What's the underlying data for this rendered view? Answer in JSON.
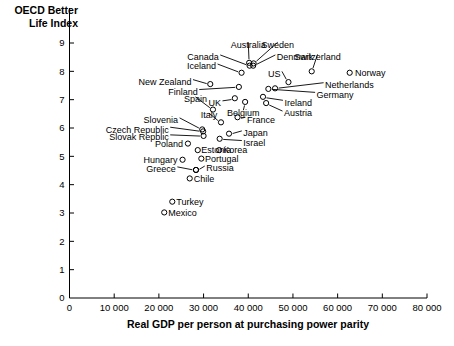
{
  "chart_data": {
    "type": "scatter",
    "title": "OECD Better Life Index",
    "ylabel": "OECD Better Life Index",
    "xlabel": "Real GDP per person at purchasing power parity",
    "xlim": [
      0,
      80000
    ],
    "ylim": [
      0,
      9
    ],
    "xticks": [
      0,
      10000,
      20000,
      30000,
      40000,
      50000,
      60000,
      70000,
      80000
    ],
    "xticklabels": [
      "0",
      "10 000",
      "20 000",
      "30 000",
      "40 000",
      "50 000",
      "60 000",
      "70 000",
      "80 000"
    ],
    "yticks": [
      0,
      1,
      2,
      3,
      4,
      5,
      6,
      7,
      8,
      9
    ],
    "yticklabels": [
      "0",
      "1",
      "2",
      "3",
      "4",
      "5",
      "6",
      "7",
      "8",
      "9"
    ],
    "grid": false,
    "legend": null,
    "marker_style": "open-circle",
    "points": [
      {
        "label": "Australia",
        "x": 40200,
        "y": 8.3,
        "lx": 40000,
        "ly": 8.95,
        "anchor": "middle"
      },
      {
        "label": "Sweden",
        "x": 41200,
        "y": 8.28,
        "lx": 46600,
        "ly": 8.95,
        "anchor": "middle"
      },
      {
        "label": "Canada",
        "x": 40300,
        "y": 8.2,
        "lx": 33400,
        "ly": 8.5,
        "anchor": "end"
      },
      {
        "label": "Denmark",
        "x": 41100,
        "y": 8.2,
        "lx": 46400,
        "ly": 8.5,
        "anchor": "start"
      },
      {
        "label": "Switzerland",
        "x": 54200,
        "y": 8.0,
        "lx": 55500,
        "ly": 8.52,
        "anchor": "middle"
      },
      {
        "label": "Iceland",
        "x": 38500,
        "y": 7.95,
        "lx": 32800,
        "ly": 8.18,
        "anchor": "end"
      },
      {
        "label": "Norway",
        "x": 62700,
        "y": 7.95,
        "lx": 63900,
        "ly": 7.95,
        "anchor": "start"
      },
      {
        "label": "US",
        "x": 49000,
        "y": 7.62,
        "lx": 47200,
        "ly": 7.92,
        "anchor": "end"
      },
      {
        "label": "New Zealand",
        "x": 31500,
        "y": 7.55,
        "lx": 27300,
        "ly": 7.63,
        "anchor": "end"
      },
      {
        "label": "Netherlands",
        "x": 46000,
        "y": 7.4,
        "lx": 57200,
        "ly": 7.52,
        "anchor": "start"
      },
      {
        "label": "Finland",
        "x": 37900,
        "y": 7.45,
        "lx": 28700,
        "ly": 7.28,
        "anchor": "end"
      },
      {
        "label": "Germany",
        "x": 44500,
        "y": 7.38,
        "lx": 55300,
        "ly": 7.18,
        "anchor": "start"
      },
      {
        "label": "Ireland",
        "x": 43300,
        "y": 7.1,
        "lx": 48100,
        "ly": 6.9,
        "anchor": "start"
      },
      {
        "label": "UK",
        "x": 37000,
        "y": 7.05,
        "lx": 33900,
        "ly": 6.88,
        "anchor": "end"
      },
      {
        "label": "Belgium",
        "x": 39300,
        "y": 6.92,
        "lx": 38900,
        "ly": 6.55,
        "anchor": "middle"
      },
      {
        "label": "Austria",
        "x": 44000,
        "y": 6.88,
        "lx": 48000,
        "ly": 6.52,
        "anchor": "start"
      },
      {
        "label": "Spain",
        "x": 32100,
        "y": 6.65,
        "lx": 28200,
        "ly": 7.02,
        "anchor": "middle"
      },
      {
        "label": "France",
        "x": 37600,
        "y": 6.38,
        "lx": 39700,
        "ly": 6.3,
        "anchor": "start"
      },
      {
        "label": "Italy",
        "x": 33900,
        "y": 6.2,
        "lx": 31200,
        "ly": 6.45,
        "anchor": "middle"
      },
      {
        "label": "Slovenia",
        "x": 29700,
        "y": 5.95,
        "lx": 24300,
        "ly": 6.28,
        "anchor": "end"
      },
      {
        "label": "Czech Republic",
        "x": 29900,
        "y": 5.88,
        "lx": 22200,
        "ly": 5.95,
        "anchor": "end"
      },
      {
        "label": "Japan",
        "x": 35700,
        "y": 5.8,
        "lx": 38900,
        "ly": 5.82,
        "anchor": "start"
      },
      {
        "label": "Slovak Repblic",
        "x": 30000,
        "y": 5.72,
        "lx": 22200,
        "ly": 5.68,
        "anchor": "end"
      },
      {
        "label": "Israel",
        "x": 33600,
        "y": 5.62,
        "lx": 38900,
        "ly": 5.48,
        "anchor": "start"
      },
      {
        "label": "Poland",
        "x": 26500,
        "y": 5.45,
        "lx": 25400,
        "ly": 5.45,
        "anchor": "end"
      },
      {
        "label": "Korea",
        "x": 33500,
        "y": 5.22,
        "lx": 34400,
        "ly": 5.22,
        "anchor": "start"
      },
      {
        "label": "Estonia",
        "x": 28700,
        "y": 5.22,
        "lx": 29500,
        "ly": 5.22,
        "anchor": "start"
      },
      {
        "label": "Portugal",
        "x": 29500,
        "y": 4.92,
        "lx": 30300,
        "ly": 4.92,
        "anchor": "start"
      },
      {
        "label": "Hungary",
        "x": 25300,
        "y": 4.88,
        "lx": 24200,
        "ly": 4.88,
        "anchor": "end"
      },
      {
        "label": "Russia",
        "x": 28300,
        "y": 4.52,
        "lx": 30600,
        "ly": 4.58,
        "anchor": "start"
      },
      {
        "label": "Greece",
        "x": 28300,
        "y": 4.52,
        "lx": 23800,
        "ly": 4.55,
        "anchor": "end"
      },
      {
        "label": "Chile",
        "x": 26900,
        "y": 4.22,
        "lx": 27800,
        "ly": 4.22,
        "anchor": "start"
      },
      {
        "label": "Turkey",
        "x": 23000,
        "y": 3.4,
        "lx": 23900,
        "ly": 3.4,
        "anchor": "start"
      },
      {
        "label": "Mexico",
        "x": 21200,
        "y": 3.02,
        "lx": 22100,
        "ly": 3.02,
        "anchor": "start"
      }
    ]
  }
}
